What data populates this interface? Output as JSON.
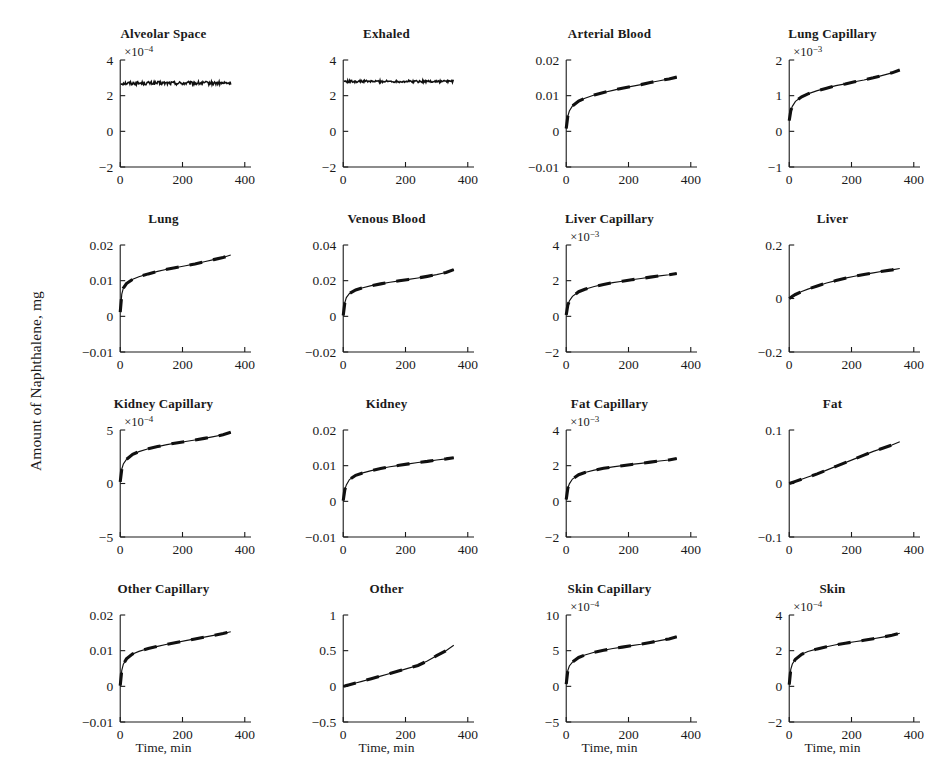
{
  "figure": {
    "ylabel": "Amount of Naphthalene, mg",
    "xlabel": "Time, min",
    "rows": 4,
    "cols": 4
  },
  "chart_data": {
    "type": "line",
    "title": "",
    "xlabel": "Time, min",
    "ylabel": "Amount of Naphthalene, mg",
    "xlim": [
      -20,
      420
    ],
    "xticks": [
      0,
      200,
      400
    ],
    "grid": false,
    "legend": "none",
    "series_style": {
      "solid": "model prediction (thin solid line)",
      "dashed": "overlaid dashed trace, nearly coincident"
    },
    "x_sample": [
      0,
      5,
      10,
      20,
      40,
      60,
      90,
      120,
      150,
      180,
      210,
      240,
      270,
      300,
      330,
      355
    ],
    "panels": [
      {
        "title": "Alveolar Space",
        "exponent": "-4",
        "exp_prefix": "×10",
        "yticks": [
          -2,
          0,
          2,
          4
        ],
        "ylim": [
          -2,
          4
        ],
        "shape": "flat-noisy",
        "noise": 0.1,
        "values": [
          2.7,
          2.7,
          2.7,
          2.7,
          2.7,
          2.7,
          2.7,
          2.7,
          2.7,
          2.7,
          2.7,
          2.7,
          2.7,
          2.7,
          2.7,
          2.7
        ]
      },
      {
        "title": "Exhaled",
        "exponent": "",
        "exp_prefix": "",
        "yticks": [
          -2,
          0,
          2,
          4
        ],
        "ylim": [
          -2,
          4
        ],
        "shape": "flat-noisy",
        "noise": 0.07,
        "values": [
          2.8,
          2.8,
          2.8,
          2.8,
          2.8,
          2.8,
          2.8,
          2.8,
          2.8,
          2.8,
          2.8,
          2.8,
          2.8,
          2.8,
          2.8,
          2.8
        ]
      },
      {
        "title": "Arterial Blood",
        "exponent": "",
        "exp_prefix": "",
        "yticks": [
          -0.01,
          0,
          0.01,
          0.02
        ],
        "ylim": [
          -0.01,
          0.02
        ],
        "shape": "rise-saturating",
        "values": [
          0.0008,
          0.0042,
          0.0057,
          0.0071,
          0.0085,
          0.0093,
          0.0102,
          0.0109,
          0.0115,
          0.0121,
          0.0126,
          0.0131,
          0.0137,
          0.0142,
          0.0147,
          0.0152
        ]
      },
      {
        "title": "Lung Capillary",
        "exponent": "-3",
        "exp_prefix": "×10",
        "yticks": [
          -1,
          0,
          1,
          2
        ],
        "ylim": [
          -1,
          2
        ],
        "shape": "rise-saturating",
        "values": [
          0.3,
          0.58,
          0.7,
          0.84,
          0.97,
          1.05,
          1.14,
          1.21,
          1.28,
          1.33,
          1.39,
          1.44,
          1.5,
          1.57,
          1.64,
          1.72
        ]
      },
      {
        "title": "Lung",
        "exponent": "",
        "exp_prefix": "",
        "yticks": [
          -0.01,
          0,
          0.01,
          0.02
        ],
        "ylim": [
          -0.01,
          0.02
        ],
        "shape": "rise-saturating",
        "values": [
          0.0012,
          0.0062,
          0.0079,
          0.0092,
          0.0104,
          0.0111,
          0.0119,
          0.0126,
          0.0132,
          0.0137,
          0.0142,
          0.0147,
          0.0153,
          0.0159,
          0.0165,
          0.0172
        ]
      },
      {
        "title": "Venous Blood",
        "exponent": "",
        "exp_prefix": "",
        "yticks": [
          -0.02,
          0,
          0.02,
          0.04
        ],
        "ylim": [
          -0.02,
          0.04
        ],
        "shape": "rise-saturating",
        "values": [
          0.0005,
          0.0075,
          0.0105,
          0.0128,
          0.0148,
          0.0159,
          0.0172,
          0.0182,
          0.0191,
          0.0199,
          0.0207,
          0.0215,
          0.0224,
          0.0234,
          0.0246,
          0.0262
        ]
      },
      {
        "title": "Liver Capillary",
        "exponent": "-3",
        "exp_prefix": "×10",
        "yticks": [
          -2,
          0,
          2,
          4
        ],
        "ylim": [
          -2,
          4
        ],
        "shape": "rise-saturating",
        "values": [
          0.08,
          0.62,
          0.86,
          1.12,
          1.38,
          1.52,
          1.67,
          1.79,
          1.89,
          1.97,
          2.05,
          2.12,
          2.2,
          2.27,
          2.33,
          2.4
        ]
      },
      {
        "title": "Liver",
        "exponent": "",
        "exp_prefix": "",
        "yticks": [
          -0.2,
          0,
          0.2
        ],
        "ylim": [
          -0.2,
          0.2
        ],
        "shape": "rise-gentle",
        "values": [
          0.0,
          0.004,
          0.008,
          0.015,
          0.026,
          0.035,
          0.047,
          0.058,
          0.067,
          0.076,
          0.083,
          0.09,
          0.096,
          0.102,
          0.107,
          0.112
        ]
      },
      {
        "title": "Kidney Capillary",
        "exponent": "-4",
        "exp_prefix": "×10",
        "yticks": [
          -5,
          0,
          5
        ],
        "ylim": [
          -5,
          5
        ],
        "shape": "rise-saturating",
        "values": [
          0.15,
          1.35,
          1.82,
          2.25,
          2.72,
          2.98,
          3.25,
          3.45,
          3.63,
          3.79,
          3.93,
          4.07,
          4.22,
          4.38,
          4.55,
          4.78
        ]
      },
      {
        "title": "Kidney",
        "exponent": "",
        "exp_prefix": "",
        "yticks": [
          -0.01,
          0,
          0.01,
          0.02
        ],
        "ylim": [
          -0.01,
          0.02
        ],
        "shape": "rise-saturating",
        "values": [
          0.0002,
          0.0032,
          0.0046,
          0.0061,
          0.0073,
          0.0079,
          0.0086,
          0.0092,
          0.0097,
          0.0101,
          0.0105,
          0.0109,
          0.0112,
          0.0116,
          0.0119,
          0.0122
        ]
      },
      {
        "title": "Fat Capillary",
        "exponent": "-3",
        "exp_prefix": "×10",
        "yticks": [
          -2,
          0,
          2,
          4
        ],
        "ylim": [
          -2,
          4
        ],
        "shape": "rise-saturating",
        "values": [
          0.1,
          0.72,
          0.98,
          1.25,
          1.49,
          1.62,
          1.75,
          1.85,
          1.93,
          2.0,
          2.07,
          2.13,
          2.2,
          2.26,
          2.32,
          2.4
        ]
      },
      {
        "title": "Fat",
        "exponent": "",
        "exp_prefix": "",
        "yticks": [
          -0.1,
          0,
          0.1
        ],
        "ylim": [
          -0.1,
          0.1
        ],
        "shape": "rise-convex",
        "values": [
          0.0,
          0.001,
          0.002,
          0.004,
          0.008,
          0.012,
          0.018,
          0.025,
          0.032,
          0.039,
          0.046,
          0.053,
          0.06,
          0.066,
          0.072,
          0.078
        ]
      },
      {
        "title": "Other Capillary",
        "exponent": "",
        "exp_prefix": "",
        "yticks": [
          -0.01,
          0,
          0.01,
          0.02
        ],
        "ylim": [
          -0.01,
          0.02
        ],
        "shape": "rise-saturating",
        "values": [
          0.0002,
          0.0045,
          0.0062,
          0.0077,
          0.0091,
          0.0098,
          0.0106,
          0.0112,
          0.0118,
          0.0123,
          0.0128,
          0.0133,
          0.0138,
          0.0143,
          0.0148,
          0.0153
        ]
      },
      {
        "title": "Other",
        "exponent": "",
        "exp_prefix": "",
        "yticks": [
          -0.5,
          0,
          0.5,
          1
        ],
        "ylim": [
          -0.5,
          1
        ],
        "shape": "rise-linear",
        "values": [
          0.0,
          0.005,
          0.011,
          0.022,
          0.046,
          0.07,
          0.106,
          0.143,
          0.18,
          0.217,
          0.255,
          0.293,
          0.355,
          0.43,
          0.5,
          0.575
        ]
      },
      {
        "title": "Skin Capillary",
        "exponent": "-4",
        "exp_prefix": "×10",
        "yticks": [
          -5,
          0,
          5,
          10
        ],
        "ylim": [
          -5,
          10
        ],
        "shape": "rise-saturating",
        "values": [
          0.3,
          2.2,
          2.85,
          3.4,
          4.05,
          4.4,
          4.78,
          5.05,
          5.3,
          5.5,
          5.7,
          5.9,
          6.15,
          6.4,
          6.65,
          6.95
        ]
      },
      {
        "title": "Skin",
        "exponent": "-4",
        "exp_prefix": "×10",
        "yticks": [
          -2,
          0,
          2,
          4
        ],
        "ylim": [
          -2,
          4
        ],
        "shape": "rise-saturating",
        "values": [
          0.1,
          0.95,
          1.25,
          1.52,
          1.8,
          1.95,
          2.1,
          2.22,
          2.33,
          2.42,
          2.5,
          2.58,
          2.67,
          2.76,
          2.86,
          2.98
        ]
      }
    ]
  }
}
